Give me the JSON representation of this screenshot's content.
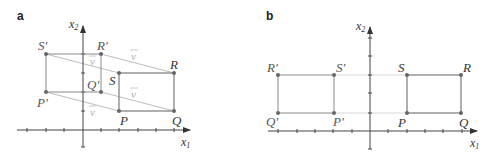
{
  "panels": [
    {
      "id": "a",
      "label": "a",
      "axis": {
        "x_label": "x",
        "x_sub": "1",
        "y_label": "x",
        "y_sub": "2"
      },
      "original_rectangle": {
        "P": {
          "label": "P",
          "coords": [
            2,
            1
          ]
        },
        "Q": {
          "label": "Q",
          "coords": [
            5,
            1
          ]
        },
        "R": {
          "label": "R",
          "coords": [
            5,
            3
          ]
        },
        "S": {
          "label": "S",
          "coords": [
            2,
            3
          ]
        }
      },
      "image_rectangle": {
        "P'": {
          "label": "P'",
          "coords": [
            -2,
            2
          ]
        },
        "Q'": {
          "label": "Q'",
          "coords": [
            1,
            2
          ]
        },
        "R'": {
          "label": "R'",
          "coords": [
            1,
            4
          ]
        },
        "S'": {
          "label": "S'",
          "coords": [
            -2,
            4
          ]
        }
      },
      "translation_vector": {
        "label": "v",
        "components": [
          -4,
          1
        ]
      },
      "vector_labels": [
        "v",
        "v",
        "v",
        "v"
      ]
    },
    {
      "id": "b",
      "label": "b",
      "axis": {
        "x_label": "x",
        "x_sub": "1",
        "y_label": "x",
        "y_sub": "2"
      },
      "original_rectangle": {
        "P": {
          "label": "P",
          "coords": [
            2,
            1
          ]
        },
        "Q": {
          "label": "Q",
          "coords": [
            5,
            1
          ]
        },
        "R": {
          "label": "R",
          "coords": [
            5,
            3
          ]
        },
        "S": {
          "label": "S",
          "coords": [
            2,
            3
          ]
        }
      },
      "image_rectangle": {
        "P'": {
          "label": "P'",
          "coords": [
            -2,
            1
          ]
        },
        "Q'": {
          "label": "Q'",
          "coords": [
            -5,
            1
          ]
        },
        "R'": {
          "label": "R'",
          "coords": [
            -5,
            3
          ]
        },
        "S'": {
          "label": "S'",
          "coords": [
            -2,
            3
          ]
        }
      },
      "transformation": "reflection across x2-axis"
    }
  ],
  "colors": {
    "shape": "#7a7a7a",
    "image_shape": "#8a8a8a",
    "axis": "#555555",
    "vector": "#bdbdbd",
    "guide": "#cfcfcf",
    "point": "#666666"
  }
}
